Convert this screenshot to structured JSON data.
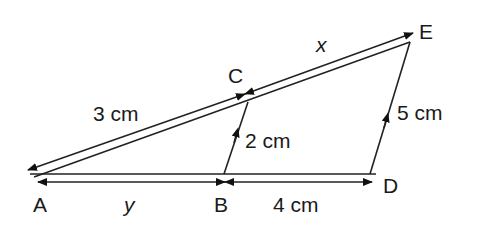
{
  "diagram": {
    "type": "similar-triangles",
    "points": {
      "A": {
        "label": "A",
        "x": 32,
        "y": 174
      },
      "B": {
        "label": "B",
        "x": 224,
        "y": 174
      },
      "C": {
        "label": "C",
        "x": 248,
        "y": 102
      },
      "D": {
        "label": "D",
        "x": 370,
        "y": 174
      },
      "E": {
        "label": "E",
        "x": 410,
        "y": 42
      }
    },
    "measurements": {
      "AC": "3 cm",
      "CE": "x",
      "BC": "2 cm",
      "DE": "5 cm",
      "AB": "y",
      "BD": "4 cm"
    },
    "colors": {
      "stroke": "#222222",
      "text": "#1a1a1a",
      "background": "#ffffff"
    }
  }
}
